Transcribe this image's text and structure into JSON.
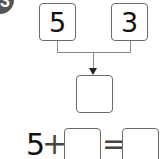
{
  "badge": {
    "label": "3"
  },
  "top_boxes": [
    {
      "value": "5"
    },
    {
      "value": "3"
    }
  ],
  "result_box": {
    "value": ""
  },
  "equation": {
    "first_operand": "5",
    "operator": "+",
    "second_operand": "",
    "equals": "=",
    "result": ""
  },
  "colors": {
    "box_border": "#6a6a6a",
    "connector": "#8a8a8a",
    "badge": "#555555"
  }
}
